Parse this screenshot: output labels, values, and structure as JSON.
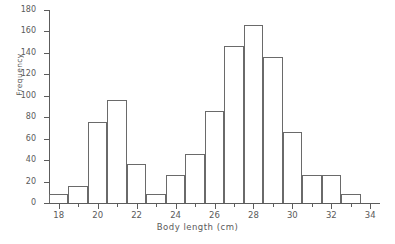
{
  "chart_data": {
    "type": "bar",
    "title": "",
    "subtitle": "",
    "xlabel": "Body length (cm)",
    "ylabel": "Frequency",
    "xlim": [
      17.5,
      34.5
    ],
    "ylim": [
      0,
      180
    ],
    "grid": false,
    "legend": null,
    "bin_width": 1,
    "x_major_ticks": [
      18,
      20,
      22,
      24,
      26,
      28,
      30,
      32,
      34
    ],
    "x_minor_ticks": [
      19,
      21,
      23,
      25,
      27,
      29,
      31,
      33
    ],
    "x_tick_labels": [
      "18",
      "20",
      "22",
      "24",
      "26",
      "28",
      "30",
      "32",
      "34"
    ],
    "y_ticks": [
      0,
      20,
      40,
      60,
      80,
      100,
      120,
      140,
      160,
      180
    ],
    "y_tick_labels": [
      "0",
      "20",
      "40",
      "60",
      "80",
      "100",
      "120",
      "140",
      "160",
      "180"
    ],
    "bar_style": "outlined",
    "bar_edge_color": "#6a6a6a",
    "bar_fill_color": "none",
    "axis_color": "#5c5c5c",
    "background_color": "#ffffff",
    "categories": [
      18,
      19,
      20,
      21,
      22,
      23,
      24,
      25,
      26,
      27,
      28,
      29,
      30,
      31,
      32,
      33
    ],
    "bin_edges": [
      [
        17.5,
        18.5
      ],
      [
        18.5,
        19.5
      ],
      [
        19.5,
        20.5
      ],
      [
        20.5,
        21.5
      ],
      [
        21.5,
        22.5
      ],
      [
        22.5,
        23.5
      ],
      [
        23.5,
        24.5
      ],
      [
        24.5,
        25.5
      ],
      [
        25.5,
        26.5
      ],
      [
        26.5,
        27.5
      ],
      [
        27.5,
        28.5
      ],
      [
        28.5,
        29.5
      ],
      [
        29.5,
        30.5
      ],
      [
        30.5,
        31.5
      ],
      [
        31.5,
        32.5
      ],
      [
        32.5,
        33.5
      ]
    ],
    "values": [
      8,
      16,
      76,
      96,
      36,
      8,
      26,
      46,
      86,
      146,
      166,
      136,
      66,
      26,
      26,
      8
    ]
  }
}
